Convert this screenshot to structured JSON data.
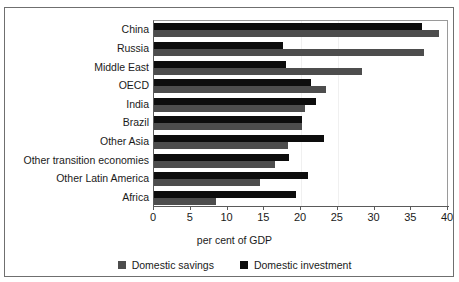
{
  "chart_data": {
    "type": "bar",
    "orientation": "horizontal",
    "title": "",
    "xlabel": "per cent of GDP",
    "ylabel": "",
    "xlim": [
      0,
      40
    ],
    "xticks": [
      0,
      5,
      10,
      15,
      20,
      25,
      30,
      35,
      40
    ],
    "grid": false,
    "legend_position": "bottom",
    "categories": [
      "China",
      "Russia",
      "Middle East",
      "OECD",
      "India",
      "Brazil",
      "Other Asia",
      "Other transition economies",
      "Other Latin America",
      "Africa"
    ],
    "series": [
      {
        "name": "Domestic investment",
        "color": "#0d0d0d",
        "values": [
          36.4,
          17.6,
          18.0,
          21.4,
          22.0,
          20.2,
          23.1,
          18.4,
          21.0,
          19.3
        ]
      },
      {
        "name": "Domestic savings",
        "color": "#4d4d4d",
        "values": [
          38.8,
          36.8,
          28.3,
          23.4,
          20.5,
          20.1,
          18.2,
          16.5,
          14.4,
          8.5
        ]
      }
    ]
  },
  "axis": {
    "tick_labels": [
      "0",
      "5",
      "10",
      "15",
      "20",
      "25",
      "30",
      "35",
      "40"
    ],
    "x_title": "per cent of GDP"
  },
  "legend": {
    "items": [
      {
        "label": "Domestic savings",
        "color": "#4d4d4d"
      },
      {
        "label": "Domestic investment",
        "color": "#0d0d0d"
      }
    ]
  }
}
